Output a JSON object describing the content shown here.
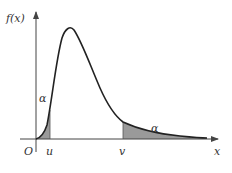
{
  "diagram": {
    "type": "probability-density-plot",
    "labels": {
      "y_axis": "f(x)",
      "x_axis": "x",
      "origin": "O",
      "lower_quantile": "u",
      "upper_quantile": "v",
      "left_tail_area": "α",
      "right_tail_area": "α"
    },
    "colors": {
      "curve": "#222222",
      "axes": "#444444",
      "shade": "#9a9a9a",
      "text": "#333333"
    }
  }
}
